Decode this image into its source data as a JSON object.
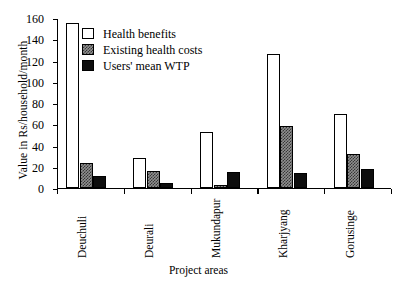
{
  "chart_data": {
    "type": "bar",
    "title": "",
    "xlabel": "Project areas",
    "ylabel": "Value in Rs/household/month",
    "categories": [
      "Deuchuli",
      "Deurali",
      "Mukundapur",
      "Kharjyang",
      "Gorusinge"
    ],
    "series": [
      {
        "name": "Health benefits",
        "values": [
          155,
          28,
          53,
          126,
          70
        ]
      },
      {
        "name": "Existing health costs",
        "values": [
          24,
          16,
          3,
          58,
          32
        ]
      },
      {
        "name": "Users' mean WTP",
        "values": [
          11,
          5,
          15,
          14,
          18
        ]
      }
    ],
    "ylim": [
      0,
      160
    ],
    "yticks": [
      0,
      20,
      40,
      60,
      80,
      100,
      120,
      140,
      160
    ],
    "ytick_labels": [
      "0",
      "20",
      "40",
      "60",
      "80",
      "100",
      "120",
      "140",
      "160"
    ],
    "grid": false,
    "legend_position": "top-left-inside",
    "xtick_rotation": -90,
    "colors": {
      "health_benefits": "#ffffff",
      "existing_health_costs": "#8f8f8f",
      "users_mean_wtp": "#0d0d0d",
      "axis": "#000000",
      "background": "#ffffff"
    }
  },
  "legend": {
    "entries": [
      {
        "label": "Health benefits",
        "swatch": "white-square-icon"
      },
      {
        "label": "Existing health costs",
        "swatch": "gray-hatched-square-icon"
      },
      {
        "label": "Users' mean WTP",
        "swatch": "black-square-icon"
      }
    ]
  },
  "axes": {
    "y_title": "Value in Rs/household/month",
    "x_title": "Project areas"
  }
}
